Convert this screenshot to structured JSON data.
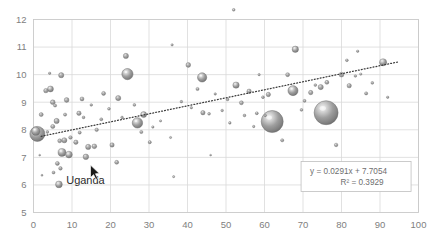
{
  "chart_data": {
    "type": "scatter",
    "subtype": "bubble",
    "title": "",
    "xlabel": "",
    "ylabel": "",
    "xlim": [
      0,
      100
    ],
    "ylim": [
      5,
      12
    ],
    "xticks": [
      0,
      10,
      20,
      30,
      40,
      50,
      60,
      70,
      80,
      90,
      100
    ],
    "yticks": [
      5,
      6,
      7,
      8,
      9,
      10,
      11,
      12
    ],
    "grid": true,
    "legend": null,
    "trendline": {
      "type": "linear-dotted",
      "equation": "y = 0.0291x + 7.7054",
      "r_squared_label": "R² = 0.3929",
      "slope": 0.0291,
      "intercept": 7.7054,
      "r_squared": 0.3929,
      "x_start": 2,
      "x_end": 95
    },
    "annotations": [
      {
        "text": "Uganda",
        "x": 13.5,
        "y": 6.05
      }
    ],
    "bubble_style": {
      "fill": "#8d8d8d",
      "highlight": "#f2f2f2",
      "edge": "#6b6b6b"
    },
    "points": [
      {
        "x": 1.0,
        "y": 7.85,
        "r": 7.5
      },
      {
        "x": 0.6,
        "y": 7.95,
        "r": 4.2
      },
      {
        "x": 2.0,
        "y": 8.55,
        "r": 2.0
      },
      {
        "x": 3.2,
        "y": 9.42,
        "r": 2.2
      },
      {
        "x": 4.4,
        "y": 9.48,
        "r": 3.0
      },
      {
        "x": 5.0,
        "y": 9.0,
        "r": 2.4
      },
      {
        "x": 5.6,
        "y": 8.88,
        "r": 1.6
      },
      {
        "x": 7.2,
        "y": 9.98,
        "r": 2.6
      },
      {
        "x": 4.2,
        "y": 10.05,
        "r": 1.2
      },
      {
        "x": 8.6,
        "y": 9.08,
        "r": 2.4
      },
      {
        "x": 8.2,
        "y": 8.55,
        "r": 1.6
      },
      {
        "x": 6.0,
        "y": 8.32,
        "r": 2.6
      },
      {
        "x": 5.0,
        "y": 8.12,
        "r": 2.1
      },
      {
        "x": 3.6,
        "y": 7.92,
        "r": 1.4
      },
      {
        "x": 6.8,
        "y": 7.6,
        "r": 2.0
      },
      {
        "x": 8.0,
        "y": 7.62,
        "r": 2.6
      },
      {
        "x": 9.6,
        "y": 7.72,
        "r": 1.8
      },
      {
        "x": 7.4,
        "y": 7.18,
        "r": 4.0
      },
      {
        "x": 9.2,
        "y": 7.1,
        "r": 3.4
      },
      {
        "x": 6.2,
        "y": 6.78,
        "r": 2.0
      },
      {
        "x": 7.0,
        "y": 6.6,
        "r": 1.8
      },
      {
        "x": 5.2,
        "y": 6.45,
        "r": 1.5
      },
      {
        "x": 6.6,
        "y": 6.02,
        "r": 3.4
      },
      {
        "x": 2.2,
        "y": 6.35,
        "r": 1.0
      },
      {
        "x": 1.6,
        "y": 7.08,
        "r": 0.9
      },
      {
        "x": 11.0,
        "y": 7.55,
        "r": 2.2
      },
      {
        "x": 12.0,
        "y": 7.9,
        "r": 1.6
      },
      {
        "x": 11.8,
        "y": 8.6,
        "r": 2.2
      },
      {
        "x": 13.0,
        "y": 8.45,
        "r": 1.4
      },
      {
        "x": 12.6,
        "y": 9.12,
        "r": 2.0
      },
      {
        "x": 14.2,
        "y": 7.38,
        "r": 2.6
      },
      {
        "x": 13.6,
        "y": 7.02,
        "r": 2.8
      },
      {
        "x": 15.8,
        "y": 7.4,
        "r": 2.4
      },
      {
        "x": 16.4,
        "y": 8.0,
        "r": 1.8
      },
      {
        "x": 17.6,
        "y": 8.38,
        "r": 1.5
      },
      {
        "x": 15.0,
        "y": 8.9,
        "r": 1.3
      },
      {
        "x": 18.2,
        "y": 9.32,
        "r": 2.0
      },
      {
        "x": 19.6,
        "y": 8.76,
        "r": 1.4
      },
      {
        "x": 20.4,
        "y": 7.45,
        "r": 2.2
      },
      {
        "x": 21.6,
        "y": 6.82,
        "r": 2.0
      },
      {
        "x": 22.0,
        "y": 9.15,
        "r": 2.6
      },
      {
        "x": 23.0,
        "y": 8.45,
        "r": 1.3
      },
      {
        "x": 24.4,
        "y": 10.02,
        "r": 5.6
      },
      {
        "x": 24.0,
        "y": 10.68,
        "r": 2.6
      },
      {
        "x": 26.2,
        "y": 8.9,
        "r": 1.4
      },
      {
        "x": 27.0,
        "y": 8.25,
        "r": 5.2
      },
      {
        "x": 28.6,
        "y": 8.55,
        "r": 3.0
      },
      {
        "x": 28.0,
        "y": 7.92,
        "r": 1.6
      },
      {
        "x": 30.2,
        "y": 7.55,
        "r": 1.6
      },
      {
        "x": 31.0,
        "y": 8.1,
        "r": 1.2
      },
      {
        "x": 33.0,
        "y": 8.32,
        "r": 1.1
      },
      {
        "x": 35.6,
        "y": 7.72,
        "r": 1.1
      },
      {
        "x": 36.4,
        "y": 6.3,
        "r": 1.1
      },
      {
        "x": 36.0,
        "y": 11.08,
        "r": 1.2
      },
      {
        "x": 38.4,
        "y": 9.02,
        "r": 1.3
      },
      {
        "x": 40.2,
        "y": 10.35,
        "r": 2.4
      },
      {
        "x": 41.0,
        "y": 8.8,
        "r": 1.2
      },
      {
        "x": 42.6,
        "y": 9.48,
        "r": 1.6
      },
      {
        "x": 43.8,
        "y": 9.9,
        "r": 4.6
      },
      {
        "x": 44.0,
        "y": 8.62,
        "r": 2.2
      },
      {
        "x": 45.6,
        "y": 8.58,
        "r": 1.4
      },
      {
        "x": 46.0,
        "y": 7.08,
        "r": 0.9
      },
      {
        "x": 47.2,
        "y": 9.3,
        "r": 1.2
      },
      {
        "x": 49.0,
        "y": 8.7,
        "r": 1.3
      },
      {
        "x": 50.4,
        "y": 9.1,
        "r": 1.4
      },
      {
        "x": 51.0,
        "y": 8.25,
        "r": 1.3
      },
      {
        "x": 52.6,
        "y": 9.62,
        "r": 3.2
      },
      {
        "x": 54.0,
        "y": 8.98,
        "r": 2.0
      },
      {
        "x": 54.8,
        "y": 8.52,
        "r": 1.4
      },
      {
        "x": 56.0,
        "y": 9.4,
        "r": 2.2
      },
      {
        "x": 57.2,
        "y": 8.12,
        "r": 1.2
      },
      {
        "x": 58.0,
        "y": 8.6,
        "r": 1.5
      },
      {
        "x": 59.6,
        "y": 9.18,
        "r": 1.4
      },
      {
        "x": 60.2,
        "y": 8.52,
        "r": 1.2
      },
      {
        "x": 58.6,
        "y": 10.0,
        "r": 1.2
      },
      {
        "x": 62.0,
        "y": 8.3,
        "r": 11.0
      },
      {
        "x": 61.0,
        "y": 9.28,
        "r": 2.2
      },
      {
        "x": 64.6,
        "y": 7.62,
        "r": 1.6
      },
      {
        "x": 66.0,
        "y": 10.0,
        "r": 2.0
      },
      {
        "x": 67.4,
        "y": 9.42,
        "r": 5.0
      },
      {
        "x": 68.0,
        "y": 10.92,
        "r": 3.2
      },
      {
        "x": 69.6,
        "y": 8.72,
        "r": 1.4
      },
      {
        "x": 70.4,
        "y": 9.05,
        "r": 1.5
      },
      {
        "x": 72.0,
        "y": 9.35,
        "r": 2.2
      },
      {
        "x": 73.2,
        "y": 9.62,
        "r": 1.4
      },
      {
        "x": 74.6,
        "y": 9.55,
        "r": 2.6
      },
      {
        "x": 76.0,
        "y": 8.62,
        "r": 12.0
      },
      {
        "x": 76.2,
        "y": 9.72,
        "r": 2.0
      },
      {
        "x": 78.6,
        "y": 7.45,
        "r": 1.8
      },
      {
        "x": 80.0,
        "y": 10.0,
        "r": 2.4
      },
      {
        "x": 81.4,
        "y": 10.52,
        "r": 1.4
      },
      {
        "x": 82.0,
        "y": 9.6,
        "r": 2.2
      },
      {
        "x": 83.6,
        "y": 9.95,
        "r": 1.3
      },
      {
        "x": 85.0,
        "y": 10.02,
        "r": 1.2
      },
      {
        "x": 84.2,
        "y": 10.85,
        "r": 1.2
      },
      {
        "x": 86.4,
        "y": 9.32,
        "r": 1.6
      },
      {
        "x": 88.0,
        "y": 9.7,
        "r": 1.4
      },
      {
        "x": 90.8,
        "y": 10.45,
        "r": 3.6
      },
      {
        "x": 92.0,
        "y": 9.18,
        "r": 1.2
      },
      {
        "x": 52.0,
        "y": 12.35,
        "r": 1.4
      }
    ]
  },
  "cursor": {
    "name": "mouse-pointer",
    "x": 14.8,
    "y": 6.72
  }
}
